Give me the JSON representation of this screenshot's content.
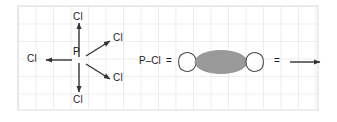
{
  "figure": {
    "background_color": "#ffffff",
    "grid_color": "#dcdcdc",
    "stroke_color": "#333333",
    "text_color": "#1c1c1c",
    "orbital_fill_color": "#9a9a9a",
    "lobe_fill_color": "#ffffff",
    "width": 337,
    "height": 122
  },
  "grid": {
    "cell_size": 17.5,
    "left": 18,
    "top": 6,
    "right": 318,
    "bottom": 110
  },
  "molecule": {
    "central_atom": "P",
    "ligands": [
      {
        "label": "Cl",
        "direction": "up"
      },
      {
        "label": "Cl",
        "direction": "left"
      },
      {
        "label": "Cl",
        "direction": "upper-right"
      },
      {
        "label": "Cl",
        "direction": "lower-right"
      },
      {
        "label": "Cl",
        "direction": "down"
      }
    ]
  },
  "legend": {
    "bond_label": "P–Cl",
    "equals_left": "=",
    "equals_right": "=",
    "arrow_label": ""
  }
}
